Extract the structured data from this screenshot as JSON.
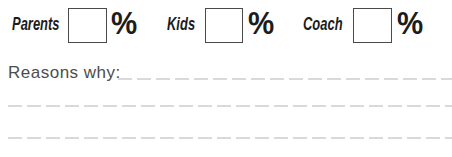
{
  "form": {
    "percent_fields": [
      {
        "label": "Parents",
        "value": "",
        "suffix": "%"
      },
      {
        "label": "Kids",
        "value": "",
        "suffix": "%"
      },
      {
        "label": "Coach",
        "value": "",
        "suffix": "%"
      }
    ],
    "reasons": {
      "label": "Reasons why:",
      "value": ""
    }
  },
  "colors": {
    "heading_text": "#1c1c1c",
    "secondary_text": "#4d4d4d",
    "box_border": "#4a4a4a",
    "writing_line": "#d9d9d9",
    "background": "#ffffff"
  }
}
